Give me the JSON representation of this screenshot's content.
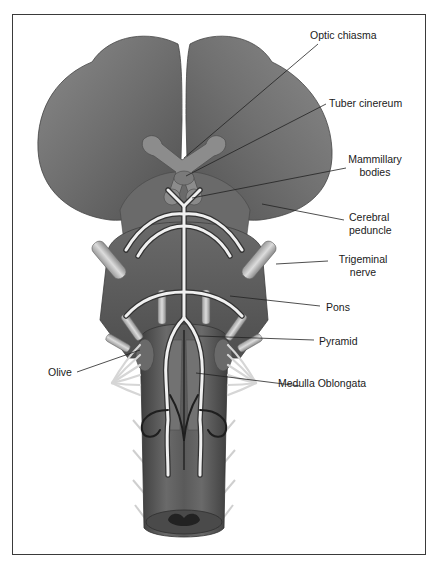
{
  "figure": {
    "labels": [
      {
        "id": "optic-chiasma",
        "lines": [
          "Optic chiasma"
        ]
      },
      {
        "id": "tuber-cinereum",
        "lines": [
          "Tuber cinereum"
        ]
      },
      {
        "id": "mammillary-bodies",
        "lines": [
          "Mammillary",
          "bodies"
        ]
      },
      {
        "id": "cerebral-peduncle",
        "lines": [
          "Cerebral",
          "peduncle"
        ]
      },
      {
        "id": "trigeminal-nerve",
        "lines": [
          "Trigeminal",
          "nerve"
        ]
      },
      {
        "id": "pons",
        "lines": [
          "Pons"
        ]
      },
      {
        "id": "pyramid",
        "lines": [
          "Pyramid"
        ]
      },
      {
        "id": "olive",
        "lines": [
          "Olive"
        ]
      },
      {
        "id": "medulla-oblongata",
        "lines": [
          "Medulla Oblongata"
        ]
      }
    ]
  },
  "colors": {
    "frame": "#3a3a3a",
    "tissue_dark": "#5a5a5a",
    "tissue_mid": "#7a7a7a",
    "tissue_light": "#9a9a9a",
    "vessel": "#e8e8e8",
    "nerve": "#c8c8c8",
    "leader": "#222222"
  }
}
